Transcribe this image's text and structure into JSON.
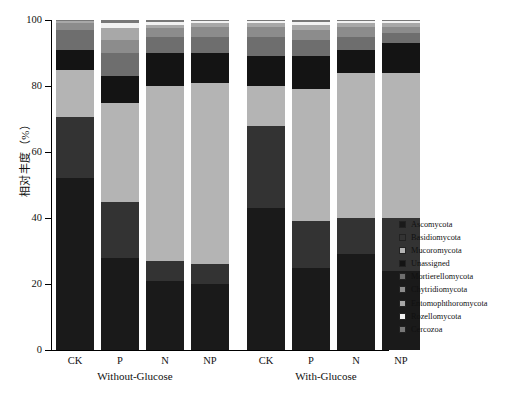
{
  "chart_data": {
    "type": "bar",
    "stacked": true,
    "title": "",
    "xlabel": "",
    "ylabel": "相对丰度（%）",
    "ylim": [
      0,
      100
    ],
    "yticks": [
      0,
      20,
      40,
      60,
      80,
      100
    ],
    "ytick_labels": [
      "0",
      "20",
      "40",
      "60",
      "80",
      "100"
    ],
    "grid": false,
    "legend_position": "right",
    "groups": [
      {
        "name": "Without-Glucose",
        "categories": [
          "CK",
          "P",
          "N",
          "NP"
        ]
      },
      {
        "name": "With-Glucose",
        "categories": [
          "CK",
          "P",
          "N",
          "NP"
        ]
      }
    ],
    "categories": [
      "CK",
      "P",
      "N",
      "NP",
      "CK",
      "P",
      "N",
      "NP"
    ],
    "series": [
      {
        "name": "Ascomycota",
        "color": "#1a1a1a",
        "values": [
          52.0,
          28.0,
          21.0,
          20.0,
          43.0,
          25.0,
          29.0,
          24.0
        ]
      },
      {
        "name": "Basidiomycota",
        "color": "#333333",
        "values": [
          18.5,
          17.0,
          6.0,
          6.0,
          25.0,
          14.0,
          11.0,
          16.0
        ]
      },
      {
        "name": "Mucoromycota",
        "color": "#b4b4b4",
        "values": [
          14.5,
          30.0,
          53.0,
          55.0,
          12.0,
          40.0,
          44.0,
          44.0
        ]
      },
      {
        "name": "Unassigned",
        "color": "#141414",
        "values": [
          6.0,
          8.0,
          10.0,
          9.0,
          9.0,
          10.0,
          7.0,
          9.0
        ]
      },
      {
        "name": "Mortierellomycota",
        "color": "#6e6e6e",
        "values": [
          6.0,
          7.0,
          5.0,
          5.0,
          6.0,
          5.0,
          4.0,
          3.0
        ]
      },
      {
        "name": "Chytridiomycota",
        "color": "#8c8c8c",
        "values": [
          2.0,
          4.0,
          2.5,
          3.0,
          3.0,
          3.0,
          3.0,
          2.0
        ]
      },
      {
        "name": "Entomophthoromycota",
        "color": "#a8a8a8",
        "values": [
          0.6,
          3.5,
          1.0,
          1.0,
          1.0,
          1.5,
          1.0,
          1.0
        ]
      },
      {
        "name": "Rozellomycota",
        "color": "#f2f2f2",
        "values": [
          0.2,
          1.5,
          0.8,
          0.6,
          0.6,
          1.0,
          0.6,
          0.6
        ]
      },
      {
        "name": "Cercozoa",
        "color": "#787878",
        "values": [
          0.2,
          1.0,
          0.7,
          0.4,
          0.4,
          0.5,
          0.4,
          0.4
        ]
      }
    ]
  },
  "axis": {
    "y_label": "相对丰度（%）",
    "tick_labels": [
      "100",
      "80",
      "60",
      "40",
      "20",
      "0"
    ]
  },
  "x_labels": [
    "CK",
    "P",
    "N",
    "NP",
    "CK",
    "P",
    "N",
    "NP"
  ],
  "group_labels": [
    "Without-Glucose",
    "With-Glucose"
  ],
  "legend": {
    "items": [
      {
        "label": "Ascomycota",
        "color": "#1a1a1a"
      },
      {
        "label": "Basidiomycota",
        "color": "#333333"
      },
      {
        "label": "Mucoromycota",
        "color": "#b4b4b4"
      },
      {
        "label": "Unassigned",
        "color": "#141414"
      },
      {
        "label": "Mortierellomycota",
        "color": "#6e6e6e"
      },
      {
        "label": "Chytridiomycota",
        "color": "#8c8c8c"
      },
      {
        "label": "Entomophthoromycota",
        "color": "#a8a8a8"
      },
      {
        "label": "Rozellomycota",
        "color": "#f2f2f2"
      },
      {
        "label": "Cercozoa",
        "color": "#787878"
      }
    ]
  }
}
